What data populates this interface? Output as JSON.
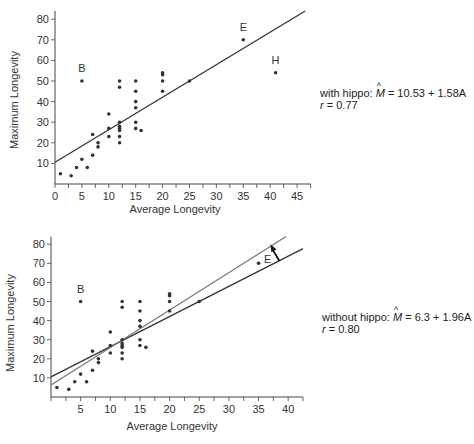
{
  "chart_data": [
    {
      "type": "scatter",
      "title": "",
      "xlabel": "Average Longevity",
      "ylabel": "Maximum Longevity",
      "xlim": [
        0,
        47
      ],
      "ylim": [
        0,
        85
      ],
      "xticks": [
        0,
        5,
        10,
        15,
        20,
        25,
        30,
        35,
        40,
        45
      ],
      "yticks": [
        10,
        20,
        30,
        40,
        50,
        60,
        70,
        80
      ],
      "grid": false,
      "points": [
        [
          1,
          5
        ],
        [
          3,
          4
        ],
        [
          4,
          8
        ],
        [
          5,
          12
        ],
        [
          6,
          8
        ],
        [
          7,
          14
        ],
        [
          7,
          24
        ],
        [
          8,
          18
        ],
        [
          8,
          20
        ],
        [
          5,
          50
        ],
        [
          10,
          23
        ],
        [
          10,
          27
        ],
        [
          10,
          34
        ],
        [
          12,
          20
        ],
        [
          12,
          23
        ],
        [
          12,
          26
        ],
        [
          12,
          27
        ],
        [
          12,
          28
        ],
        [
          12,
          30
        ],
        [
          12,
          47
        ],
        [
          12,
          50
        ],
        [
          15,
          27
        ],
        [
          15,
          30
        ],
        [
          15,
          37
        ],
        [
          15,
          40
        ],
        [
          15,
          45
        ],
        [
          15,
          50
        ],
        [
          16,
          26
        ],
        [
          20,
          45
        ],
        [
          20,
          50
        ],
        [
          20,
          53
        ],
        [
          20,
          54
        ],
        [
          25,
          50
        ],
        [
          35,
          70
        ],
        [
          41,
          54
        ]
      ],
      "point_labels": [
        {
          "label": "B",
          "x": 5,
          "y": 50
        },
        {
          "label": "E",
          "x": 35,
          "y": 70
        },
        {
          "label": "H",
          "x": 41,
          "y": 54
        }
      ],
      "fit_lines": [
        {
          "name": "with hippo",
          "intercept": 10.53,
          "slope": 1.58
        }
      ],
      "annotation": {
        "prefix": "with hippo: ",
        "lhs": "M",
        "equation": " = 10.53 + 1.58A",
        "r_label": "r",
        "r_value": " = 0.77"
      }
    },
    {
      "type": "scatter",
      "title": "",
      "xlabel": "Average Longevity",
      "ylabel": "Maximum Longevity",
      "xlim": [
        0,
        42
      ],
      "ylim": [
        0,
        85
      ],
      "xticks": [
        5,
        10,
        15,
        20,
        25,
        30,
        35,
        40
      ],
      "yticks": [
        10,
        20,
        30,
        40,
        50,
        60,
        70,
        80
      ],
      "grid": false,
      "points": [
        [
          1,
          5
        ],
        [
          3,
          4
        ],
        [
          4,
          8
        ],
        [
          5,
          12
        ],
        [
          6,
          8
        ],
        [
          7,
          14
        ],
        [
          7,
          24
        ],
        [
          8,
          18
        ],
        [
          8,
          20
        ],
        [
          5,
          50
        ],
        [
          10,
          23
        ],
        [
          10,
          27
        ],
        [
          10,
          34
        ],
        [
          12,
          20
        ],
        [
          12,
          23
        ],
        [
          12,
          26
        ],
        [
          12,
          27
        ],
        [
          12,
          28
        ],
        [
          12,
          30
        ],
        [
          12,
          47
        ],
        [
          12,
          50
        ],
        [
          15,
          27
        ],
        [
          15,
          30
        ],
        [
          15,
          37
        ],
        [
          15,
          40
        ],
        [
          15,
          45
        ],
        [
          15,
          50
        ],
        [
          16,
          26
        ],
        [
          20,
          45
        ],
        [
          20,
          50
        ],
        [
          20,
          53
        ],
        [
          20,
          54
        ],
        [
          25,
          50
        ],
        [
          35,
          70
        ]
      ],
      "point_labels": [
        {
          "label": "B",
          "x": 5,
          "y": 50
        },
        {
          "label": "E",
          "x": 35,
          "y": 70
        }
      ],
      "fit_lines": [
        {
          "name": "with hippo",
          "intercept": 10.53,
          "slope": 1.58,
          "color": "#333333"
        },
        {
          "name": "without hippo",
          "intercept": 6.3,
          "slope": 1.96,
          "color": "#777777"
        }
      ],
      "arrow": {
        "from": [
          38.5,
          71.3
        ],
        "to": [
          37,
          80
        ],
        "meaning": "line shifts up when hippo removed"
      },
      "annotation": {
        "prefix": "without hippo: ",
        "lhs": "M",
        "equation": " = 6.3 + 1.96A",
        "r_label": "r",
        "r_value": " = 0.80"
      }
    }
  ]
}
